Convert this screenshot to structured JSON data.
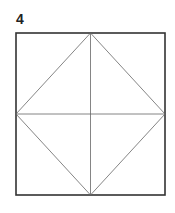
{
  "figure": {
    "label": "4",
    "square": {
      "x1": 16,
      "y1": 33,
      "x2": 165,
      "y2": 195
    },
    "border_color": "#333333",
    "line_color": "#666666"
  }
}
